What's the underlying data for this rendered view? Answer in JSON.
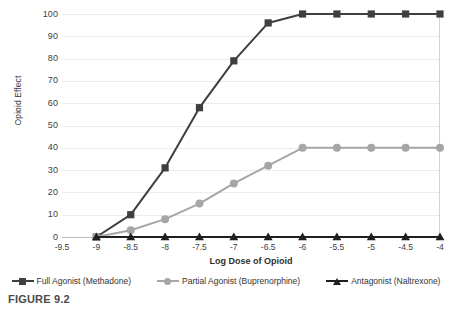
{
  "figure": {
    "caption": "FIGURE 9.2"
  },
  "chart_data": {
    "type": "line",
    "title": "",
    "xlabel": "Log Dose of Opioid",
    "ylabel": "Opioid Effect",
    "x": [
      -9.5,
      -9,
      -8.5,
      -8,
      -7.5,
      -7,
      -6.5,
      -6,
      -5.5,
      -5,
      -4.5,
      -4
    ],
    "x_tick_labels": [
      "-9.5",
      "-9",
      "-8.5",
      "-8",
      "-7.5",
      "-7",
      "-6.5",
      "-6",
      "-5.5",
      "-5",
      "-4.5",
      "-4"
    ],
    "xlim": [
      -9.5,
      -4
    ],
    "ylim": [
      0,
      100
    ],
    "y_ticks": [
      0,
      10,
      20,
      30,
      40,
      50,
      60,
      70,
      80,
      90,
      100
    ],
    "y_tick_labels": [
      "0",
      "10",
      "20",
      "30",
      "40",
      "50",
      "60",
      "70",
      "80",
      "90",
      "100"
    ],
    "grid": true,
    "grid_axis": "y",
    "legend_position": "bottom",
    "series": [
      {
        "name": "Full Agonist (Methadone)",
        "marker": "square",
        "color": "#3f3f3f",
        "x": [
          -9,
          -8.5,
          -8,
          -7.5,
          -7,
          -6.5,
          -6,
          -5.5,
          -5,
          -4.5,
          -4
        ],
        "values": [
          0,
          10,
          31,
          58,
          79,
          96,
          100,
          100,
          100,
          100,
          100
        ]
      },
      {
        "name": "Partial Agonist (Buprenorphine)",
        "marker": "circle",
        "color": "#a6a6a6",
        "x": [
          -9,
          -8.5,
          -8,
          -7.5,
          -7,
          -6.5,
          -6,
          -5.5,
          -5,
          -4.5,
          -4
        ],
        "values": [
          0,
          3,
          8,
          15,
          24,
          32,
          40,
          40,
          40,
          40,
          40
        ]
      },
      {
        "name": "Antagonist (Naltrexone)",
        "marker": "triangle",
        "color": "#1f1f1f",
        "x": [
          -9,
          -8.5,
          -8,
          -7.5,
          -7,
          -6.5,
          -6,
          -5.5,
          -5,
          -4.5,
          -4
        ],
        "values": [
          0,
          0,
          0,
          0,
          0,
          0,
          0,
          0,
          0,
          0,
          0
        ]
      }
    ]
  }
}
